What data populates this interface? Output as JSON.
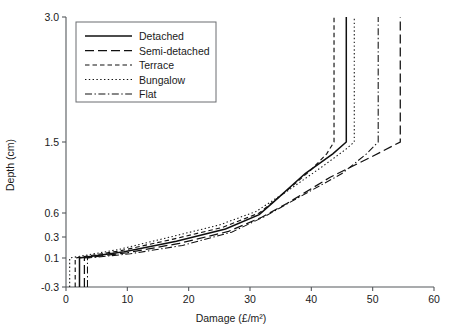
{
  "figure": {
    "background": "#ffffff",
    "line_color": "#101010",
    "axis_color": "#55585c"
  },
  "axes": {
    "x": {
      "label": "Damage (£/m²)",
      "ticks": [
        "0",
        "10",
        "20",
        "30",
        "40",
        "50",
        "60"
      ],
      "tick_values": [
        0,
        10,
        20,
        30,
        40,
        50,
        60
      ],
      "min": 0,
      "max": 60
    },
    "y": {
      "label": "Depth (cm)",
      "ticks": [
        "3.0",
        "1.5",
        "0.6",
        "0.3",
        "0.1",
        "-0.3"
      ],
      "tick_values": [
        3.0,
        1.5,
        0.6,
        0.3,
        0.1,
        -0.3
      ],
      "min": -0.3,
      "max": 3.0
    }
  },
  "legend": {
    "position": "top-left",
    "entries": [
      {
        "label": "Detached",
        "dash": "solid"
      },
      {
        "label": "Semi-detached",
        "dash": "long-dash"
      },
      {
        "label": "Terrace",
        "dash": "short-dash"
      },
      {
        "label": "Bungalow",
        "dash": "dotted"
      },
      {
        "label": "Flat",
        "dash": "dash-dot"
      }
    ]
  },
  "chart_data": {
    "type": "line",
    "title": "",
    "xlabel": "Damage (£/m²)",
    "ylabel": "Depth (cm)",
    "xlim": [
      0,
      60
    ],
    "ylim": [
      -0.3,
      3.0
    ],
    "grid": false,
    "legend_position": "top-left",
    "y_axis_scale": "non-linear (0.1/0.3/0.6/1.5/3.0 spacing)",
    "note": "Depth-damage curves: damage on x-axis, flood depth on y-axis",
    "series": [
      {
        "name": "Detached",
        "dash": "solid",
        "x": [
          2.2,
          2.2,
          9.5,
          18.0,
          26.0,
          31.5,
          34.0,
          39.0,
          43.5,
          45.7,
          45.7
        ],
        "y": [
          -0.3,
          0.1,
          0.16,
          0.26,
          0.4,
          0.58,
          0.75,
          1.1,
          1.35,
          1.5,
          3.0
        ]
      },
      {
        "name": "Semi-detached",
        "dash": "long-dash",
        "x": [
          3.0,
          3.0,
          10.0,
          18.5,
          26.5,
          32.0,
          36.0,
          43.0,
          50.0,
          54.5,
          54.5
        ],
        "y": [
          -0.3,
          0.1,
          0.15,
          0.24,
          0.37,
          0.55,
          0.72,
          1.05,
          1.32,
          1.5,
          3.0
        ]
      },
      {
        "name": "Terrace",
        "dash": "short-dash",
        "x": [
          1.5,
          1.5,
          9.0,
          17.5,
          25.5,
          31.5,
          35.5,
          40.0,
          42.5,
          43.7,
          43.7
        ],
        "y": [
          -0.3,
          0.1,
          0.17,
          0.28,
          0.42,
          0.6,
          0.85,
          1.15,
          1.35,
          1.5,
          3.0
        ]
      },
      {
        "name": "Bungalow",
        "dash": "dotted",
        "x": [
          0.6,
          0.6,
          8.5,
          17.0,
          25.0,
          31.0,
          36.5,
          42.0,
          45.5,
          47.0,
          47.0
        ],
        "y": [
          -0.3,
          0.1,
          0.18,
          0.3,
          0.45,
          0.62,
          0.9,
          1.2,
          1.4,
          1.5,
          3.0
        ]
      },
      {
        "name": "Flat",
        "dash": "dash-dot",
        "x": [
          3.5,
          3.5,
          10.5,
          19.0,
          27.0,
          32.5,
          38.0,
          45.0,
          49.0,
          50.9,
          50.9
        ],
        "y": [
          -0.3,
          0.1,
          0.14,
          0.22,
          0.36,
          0.56,
          0.8,
          1.1,
          1.35,
          1.5,
          3.0
        ]
      }
    ]
  }
}
